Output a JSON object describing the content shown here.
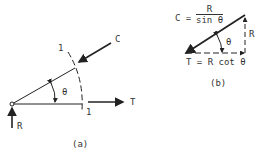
{
  "figure_a": {
    "caption": "(a)",
    "labels": {
      "compression": "C",
      "tension": "T",
      "reaction": "R",
      "angle": "θ",
      "section_top": "1",
      "section_bottom": "1"
    }
  },
  "figure_b": {
    "caption": "(b)",
    "compression_lhs": "C =",
    "compression_num": "R",
    "compression_den": "sin θ",
    "reaction": "R",
    "angle": "θ",
    "tension_eq": "T = R cot θ"
  }
}
